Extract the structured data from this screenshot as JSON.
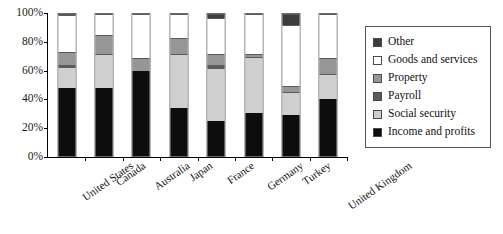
{
  "chart_data": {
    "type": "bar",
    "subtype": "stacked-100-percent",
    "title": "",
    "xlabel": "",
    "ylabel": "",
    "ylim": [
      0,
      100
    ],
    "ytick_labels": [
      "0%",
      "20%",
      "40%",
      "60%",
      "80%",
      "100%"
    ],
    "ytick_values": [
      0,
      20,
      40,
      60,
      80,
      100
    ],
    "grid": false,
    "legend_position": "right",
    "categories": [
      "United States",
      "Canada",
      "Australia",
      "Japan",
      "France",
      "Germany",
      "Turkey",
      "United Kingdom"
    ],
    "series": [
      {
        "name": "Income and profits",
        "color": "#0d0d0d",
        "values": [
          48,
          48,
          60,
          34,
          25,
          30,
          29,
          40
        ]
      },
      {
        "name": "Social security",
        "color": "#cfcfcf",
        "values": [
          15,
          24,
          0,
          38,
          37,
          40,
          16,
          18
        ]
      },
      {
        "name": "Payroll",
        "color": "#5c5c5c",
        "values": [
          1,
          0,
          0,
          0,
          2,
          0,
          0,
          0
        ]
      },
      {
        "name": "Property",
        "color": "#969696",
        "values": [
          9,
          13,
          9,
          11,
          8,
          2,
          4,
          11
        ]
      },
      {
        "name": "Goods and services",
        "color": "#ffffff",
        "values": [
          26,
          15,
          31,
          17,
          25,
          28,
          43,
          31
        ]
      },
      {
        "name": "Other",
        "color": "#3d3d3d",
        "values": [
          1,
          0,
          0,
          0,
          3,
          0,
          8,
          0
        ]
      }
    ]
  },
  "legend": {
    "items": [
      {
        "label": "Other",
        "color": "#3d3d3d"
      },
      {
        "label": "Goods and services",
        "color": "#ffffff"
      },
      {
        "label": "Property",
        "color": "#969696"
      },
      {
        "label": "Payroll",
        "color": "#5c5c5c"
      },
      {
        "label": "Social security",
        "color": "#cfcfcf"
      },
      {
        "label": "Income and profits",
        "color": "#0d0d0d"
      }
    ]
  }
}
